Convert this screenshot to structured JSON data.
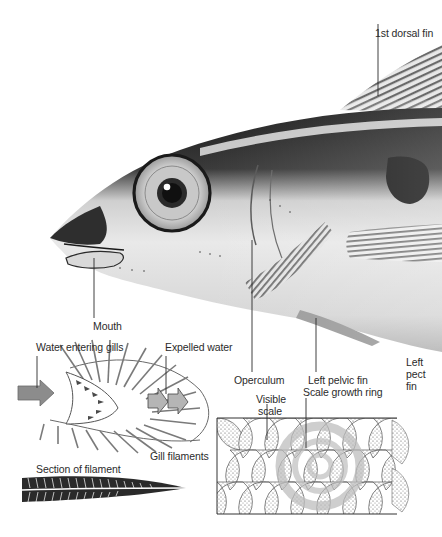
{
  "diagram": {
    "labels": {
      "dorsal_fin": "1st dorsal fin",
      "mouth": "Mouth",
      "operculum": "Operculum",
      "left_pelvic_fin": "Left pelvic fin",
      "left_pectoral_fin_line1": "Left",
      "left_pectoral_fin_line2": "pect",
      "left_pectoral_fin_line3": "fin",
      "water_entering_gills": "Water entering gills",
      "expelled_water": "Expelled water",
      "gill_filaments": "Gill filaments",
      "section_of_filament": "Section of filament",
      "visible_scale_line1": "Visible",
      "visible_scale_line2": "scale",
      "scale_growth_ring": "Scale growth ring"
    },
    "colors": {
      "ink": "#2b2b2b",
      "fish_dark": "#1e1e1e",
      "fish_mid": "#8a8a8a",
      "fish_light": "#e6e6e6",
      "arrow_fill": "#8c8c8c",
      "growth_ring": "#bdbdbd"
    }
  }
}
